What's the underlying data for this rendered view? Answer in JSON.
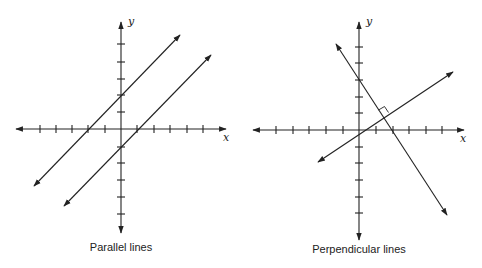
{
  "panels": [
    {
      "caption": "Parallel lines",
      "x_axis_label": "x",
      "y_axis_label": "y",
      "lines": [
        {
          "name": "upper-line",
          "slope": 1,
          "y_intercept": 2,
          "x_intercept": -2
        },
        {
          "name": "lower-line",
          "slope": 1,
          "y_intercept": -1,
          "x_intercept": 1
        }
      ]
    },
    {
      "caption": "Perpendicular lines",
      "x_axis_label": "x",
      "y_axis_label": "y",
      "lines": [
        {
          "name": "steep-line",
          "slope": -1.5,
          "y_intercept": 3,
          "x_intercept": 2
        },
        {
          "name": "shallow-line",
          "slope": 0.6667,
          "y_intercept": 0,
          "x_intercept": 0
        }
      ],
      "right_angle_marker": true
    }
  ],
  "colors": {
    "ink": "#222222",
    "background": "#ffffff"
  }
}
